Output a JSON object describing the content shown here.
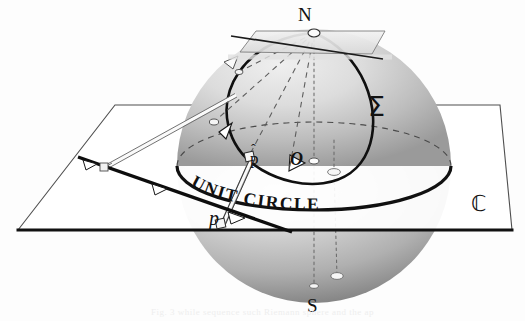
{
  "figure": {
    "kind": "stereographic-projection-diagram",
    "labels": {
      "north_pole": "N",
      "south_pole": "S",
      "sphere": "Σ",
      "plane": "ℂ",
      "projected_point": "p",
      "sphere_point_base": "p",
      "sphere_point_hat": "ˆ",
      "origin": "O",
      "equator": "UNIT CIRCLE"
    },
    "equator_text_letters": [
      "U",
      "N",
      "I",
      "T",
      " ",
      "C",
      "I",
      "R",
      "C",
      "L",
      "E"
    ],
    "ghost_text": "Fig. 3   while    sequence    such   Riemann sphere and   the  ap"
  },
  "geometry": {
    "sphere": {
      "cx": 314,
      "cy": 166,
      "r": 137
    },
    "north_pole_point": {
      "x": 314,
      "y": 33
    },
    "south_pole_point": {
      "x": 314,
      "y": 288
    },
    "origin_point": {
      "x": 314,
      "y": 161
    },
    "p_hat_point": {
      "x": 249,
      "y": 156
    },
    "p_point": {
      "x": 225,
      "y": 223
    },
    "plane_corners": [
      [
        18,
        230
      ],
      [
        115,
        105
      ],
      [
        500,
        105
      ],
      [
        512,
        230
      ]
    ],
    "tangent_plane_corners": [
      [
        240,
        52
      ],
      [
        256,
        31
      ],
      [
        385,
        31
      ],
      [
        372,
        54
      ]
    ]
  },
  "colors": {
    "ink": "#151515",
    "paper": "#fdfdfd",
    "sphere_light": "#e6e6e6",
    "sphere_mid": "#b9b9b9",
    "sphere_dark": "#8e8e8e",
    "sphere_shadow": "#6e6e6e",
    "plane_fill": "#ffffff",
    "plane_stroke": "#4a4a4a",
    "dash_stroke": "#5a5a5a",
    "arrow_fill": "#ffffff",
    "ghost": "#eeeeee"
  }
}
